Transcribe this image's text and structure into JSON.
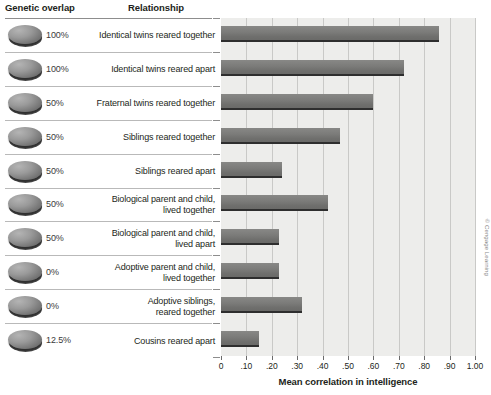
{
  "headers": {
    "overlap": "Genetic overlap",
    "relationship": "Relationship"
  },
  "credit": "© Cengage Learning",
  "chart_data": {
    "type": "bar",
    "orientation": "horizontal",
    "title": "",
    "xlabel": "Mean correlation in intelligence",
    "ylabel": "",
    "xlim": [
      0,
      1.0
    ],
    "xticks": [
      0,
      0.1,
      0.2,
      0.3,
      0.4,
      0.5,
      0.6,
      0.7,
      0.8,
      0.9,
      1.0
    ],
    "xtick_labels": [
      "0",
      ".10",
      ".20",
      ".30",
      ".40",
      ".50",
      ".60",
      ".70",
      ".80",
      ".90",
      "1.00"
    ],
    "grid": "vertical",
    "legend": "none",
    "bar_color": "#7b7b79",
    "plot_background": "#ededeb",
    "categories": [
      "Identical twins reared together",
      "Identical twins reared apart",
      "Fraternal twins reared together",
      "Siblings reared together",
      "Siblings reared apart",
      "Biological parent and child, lived together",
      "Biological parent and child, lived apart",
      "Adoptive parent and child, lived together",
      "Adoptive siblings, reared together",
      "Cousins reared apart"
    ],
    "values": [
      0.86,
      0.72,
      0.6,
      0.47,
      0.24,
      0.42,
      0.23,
      0.23,
      0.32,
      0.15
    ],
    "genetic_overlap": [
      "100%",
      "100%",
      "50%",
      "50%",
      "50%",
      "50%",
      "50%",
      "0%",
      "0%",
      "12.5%"
    ]
  },
  "rows": [
    {
      "pct": "100%",
      "line1": "Identical twins reared together",
      "line2": "",
      "value": 0.86
    },
    {
      "pct": "100%",
      "line1": "Identical twins reared apart",
      "line2": "",
      "value": 0.72
    },
    {
      "pct": "50%",
      "line1": "Fraternal twins reared together",
      "line2": "",
      "value": 0.6
    },
    {
      "pct": "50%",
      "line1": "Siblings reared together",
      "line2": "",
      "value": 0.47
    },
    {
      "pct": "50%",
      "line1": "Siblings reared apart",
      "line2": "",
      "value": 0.24
    },
    {
      "pct": "50%",
      "line1": "Biological parent and child,",
      "line2": "lived together",
      "value": 0.42
    },
    {
      "pct": "50%",
      "line1": "Biological parent and child,",
      "line2": "lived apart",
      "value": 0.23
    },
    {
      "pct": "0%",
      "line1": "Adoptive parent and child,",
      "line2": "lived together",
      "value": 0.23
    },
    {
      "pct": "0%",
      "line1": "Adoptive siblings,",
      "line2": "reared together",
      "value": 0.32
    },
    {
      "pct": "12.5%",
      "line1": "Cousins reared apart",
      "line2": "",
      "value": 0.15
    }
  ]
}
